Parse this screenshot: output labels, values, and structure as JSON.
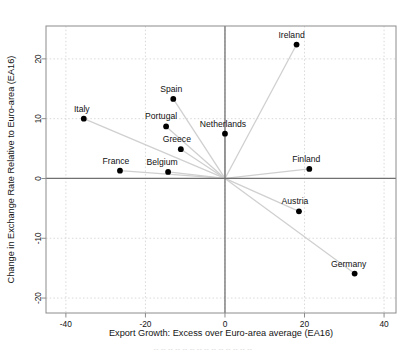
{
  "chart_data": {
    "type": "scatter",
    "title": "",
    "xlabel": "Export Growth: Excess over Euro-area average (EA16)",
    "ylabel": "Change in Exchange Rate Relative to Euro-area (EA16)",
    "xlim": [
      -45,
      43
    ],
    "ylim": [
      -22.5,
      25.5
    ],
    "xticks": [
      -40,
      -20,
      0,
      20,
      40
    ],
    "yticks": [
      -20,
      -10,
      0,
      10,
      20
    ],
    "xtick_labels": [
      "-40",
      "-20",
      "0",
      "20",
      "40"
    ],
    "ytick_labels": [
      "-20",
      "-10",
      "0",
      "10",
      "20"
    ],
    "grid": true,
    "grid_style": "dotted",
    "legend": "none",
    "origin_rays": true,
    "origin": [
      0,
      0
    ],
    "points": [
      {
        "label": "Ireland",
        "x": 18.0,
        "y": 22.4,
        "label_dx": -5,
        "label_dy": -7
      },
      {
        "label": "Spain",
        "x": -13.0,
        "y": 13.3,
        "label_dx": -2,
        "label_dy": -7
      },
      {
        "label": "Italy",
        "x": -35.5,
        "y": 10.0,
        "label_dx": -2,
        "label_dy": -7
      },
      {
        "label": "Portugal",
        "x": -14.8,
        "y": 8.7,
        "label_dx": -5,
        "label_dy": -7
      },
      {
        "label": "Netherlands",
        "x": 0.0,
        "y": 7.5,
        "label_dx": -2,
        "label_dy": -7
      },
      {
        "label": "Greece",
        "x": -11.1,
        "y": 4.9,
        "label_dx": -4,
        "label_dy": -7
      },
      {
        "label": "Finland",
        "x": 21.2,
        "y": 1.6,
        "label_dx": -3,
        "label_dy": -7
      },
      {
        "label": "Belgium",
        "x": -14.3,
        "y": 1.1,
        "label_dx": -6,
        "label_dy": -7
      },
      {
        "label": "France",
        "x": -26.4,
        "y": 1.3,
        "label_dx": -4,
        "label_dy": -7
      },
      {
        "label": "Austria",
        "x": 18.6,
        "y": -5.5,
        "label_dx": -4,
        "label_dy": -7
      },
      {
        "label": "Germany",
        "x": 32.6,
        "y": -15.9,
        "label_dx": -6,
        "label_dy": -7
      }
    ],
    "colors": {
      "point": "#000000",
      "ray": "#d0d0d0",
      "grid": "#cfcfcf",
      "axis": "#707070",
      "frame": "#8c8c8c",
      "text": "#141414"
    }
  },
  "caption": {
    "cut_off_text": "-- -- -- -- -- -- -- -- -- -- -- -- -- --"
  }
}
